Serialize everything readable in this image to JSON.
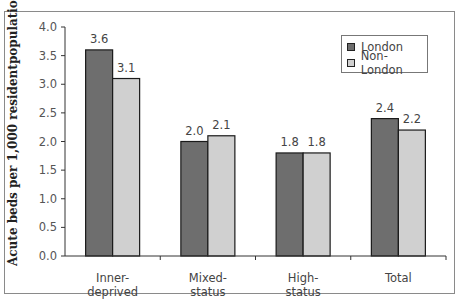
{
  "chart_data": {
    "type": "bar",
    "title": "",
    "xlabel": "",
    "ylabel": "Acute beds per 1,000 residentpopulation",
    "ylim": [
      0,
      4.0
    ],
    "yticks": [
      "0.0",
      "0.5",
      "1.0",
      "1.5",
      "2.0",
      "2.5",
      "3.0",
      "3.5",
      "4.0"
    ],
    "categories": [
      "Inner-deprived",
      "Mixed-status",
      "High-status",
      "Total"
    ],
    "category_lines": [
      [
        "Inner-",
        "deprived"
      ],
      [
        "Mixed-",
        "status"
      ],
      [
        "High-",
        "status"
      ],
      [
        "Total"
      ]
    ],
    "series": [
      {
        "name": "London",
        "color": "#6e6e6e",
        "values": [
          3.6,
          2.0,
          1.8,
          2.4
        ],
        "labels": [
          "3.6",
          "2.0",
          "1.8",
          "2.4"
        ]
      },
      {
        "name": "Non-London",
        "color": "#d0d0d0",
        "values": [
          3.1,
          2.1,
          1.8,
          2.2
        ],
        "labels": [
          "3.1",
          "2.1",
          "1.8",
          "2.2"
        ]
      }
    ],
    "grid": false,
    "legend_position": "top-right"
  },
  "legend": {
    "items": [
      {
        "label": "London",
        "color": "#6e6e6e"
      },
      {
        "label": "Non-London",
        "color": "#d0d0d0"
      }
    ]
  }
}
